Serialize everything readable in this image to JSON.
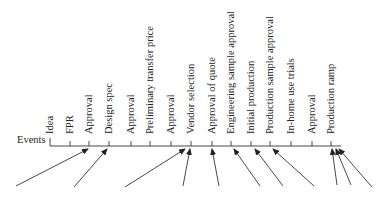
{
  "diagram": {
    "axis_label": "Events",
    "events": [
      {
        "label": "Idea"
      },
      {
        "label": "FPR"
      },
      {
        "label": "Approval"
      },
      {
        "label": "Design spec"
      },
      {
        "label": "Approval"
      },
      {
        "label": "Preliminary transfer price"
      },
      {
        "label": "Approval"
      },
      {
        "label": "Vendor selection"
      },
      {
        "label": "Approval of quote"
      },
      {
        "label": "Engineering sample approval"
      },
      {
        "label": "Initial production"
      },
      {
        "label": "Production sample approval"
      },
      {
        "label": "In-home use trials"
      },
      {
        "label": "Approval"
      },
      {
        "label": "Production ramp"
      }
    ],
    "arrow_target_event_indices": [
      2,
      3,
      7,
      7,
      8,
      9,
      10,
      11,
      14,
      14,
      14
    ],
    "colors": {
      "line": "#333333",
      "text": "#222222",
      "background": "#ffffff"
    }
  }
}
